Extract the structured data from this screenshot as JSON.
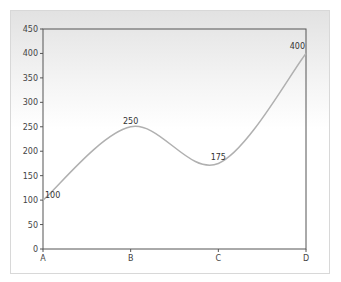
{
  "chart_data": {
    "type": "line",
    "smooth": true,
    "title": "",
    "xlabel": "",
    "ylabel": "",
    "categories": [
      "A",
      "B",
      "C",
      "D"
    ],
    "series": [
      {
        "name": "series-1",
        "values": [
          100,
          250,
          175,
          400
        ],
        "color": "#b0b0b0"
      }
    ],
    "data_labels": [
      "100",
      "250",
      "175",
      "400"
    ],
    "ylim": [
      0,
      450
    ],
    "yticks": [
      0,
      50,
      100,
      150,
      200,
      250,
      300,
      350,
      400,
      450
    ],
    "ytick_labels": [
      "0",
      "50",
      "100",
      "150",
      "200",
      "250",
      "300",
      "350",
      "400",
      "450"
    ],
    "grid": false,
    "legend": null
  },
  "colors": {
    "axis": "#555555",
    "line": "#b0b0b0",
    "frame_border": "#d8d8d8"
  }
}
